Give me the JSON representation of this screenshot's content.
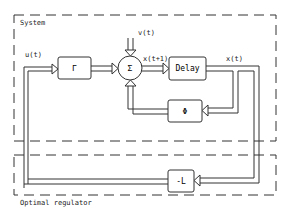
{
  "diagram": {
    "regions": {
      "system": "System",
      "regulator": "Optimal regulator"
    },
    "blocks": {
      "gamma": "Γ",
      "sum": "Σ",
      "delay": "Delay",
      "phi": "Φ",
      "gain": "-L"
    },
    "signals": {
      "u": "u(t)",
      "v": "v(t)",
      "x_next": "x(t+1)",
      "x": "x(t)"
    },
    "colors": {
      "line": "#333333",
      "background": "#ffffff"
    }
  }
}
